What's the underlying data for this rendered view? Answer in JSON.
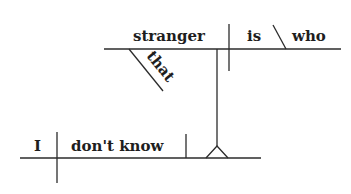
{
  "diagram": {
    "type": "sentence-diagram",
    "sentence": "I don't know who that stranger is",
    "main_clause": {
      "subject": "I",
      "verb": "don't know"
    },
    "noun_clause": {
      "subject": "stranger",
      "verb": "is",
      "predicate_nominative": "who",
      "modifier": "that"
    }
  }
}
